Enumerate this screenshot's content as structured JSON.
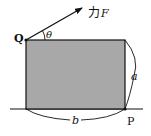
{
  "diagram": {
    "type": "physics-force-on-block",
    "labels": {
      "force": "力F",
      "force_prefix": "力",
      "force_symbol": "F",
      "angle": "θ",
      "corner_top_left": "Q",
      "corner_bottom_right": "P",
      "height": "a",
      "width": "b"
    },
    "colors": {
      "block_fill": "#a8a8a8",
      "stroke": "#111111",
      "background": "#ffffff"
    }
  }
}
